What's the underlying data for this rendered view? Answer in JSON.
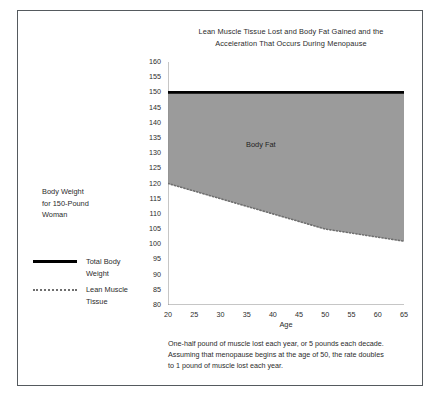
{
  "chart_data": {
    "type": "area",
    "title": "Lean Muscle Tissue Lost and Body Fat Gained and the Acceleration That Occurs During Menopause",
    "title_line1": "Lean Muscle Tissue Lost and Body Fat Gained and the",
    "title_line2": "Acceleration That Occurs During Menopause",
    "xlabel": "Age",
    "ylabel": "",
    "xlim": [
      20,
      65
    ],
    "ylim": [
      80,
      160
    ],
    "xticks": [
      20,
      25,
      30,
      35,
      40,
      45,
      50,
      55,
      60,
      65
    ],
    "yticks": [
      80,
      85,
      90,
      95,
      100,
      105,
      110,
      115,
      120,
      125,
      130,
      135,
      140,
      145,
      150,
      155,
      160
    ],
    "grid": false,
    "legend_position": "left",
    "x": [
      20,
      25,
      30,
      35,
      40,
      45,
      50,
      55,
      60,
      65
    ],
    "series": [
      {
        "name": "Total Body Weight",
        "style": "solid-thick",
        "color": "#000000",
        "values": [
          150,
          150,
          150,
          150,
          150,
          150,
          150,
          150,
          150,
          150
        ]
      },
      {
        "name": "Lean Muscle Tissue",
        "style": "dotted",
        "color": "#6f6f6f",
        "values": [
          120,
          117.5,
          115,
          112.5,
          110,
          107.5,
          105,
          103.7,
          102.4,
          101
        ]
      }
    ],
    "fill": {
      "label": "Body Fat",
      "between": [
        "Total Body Weight",
        "Lean Muscle Tissue"
      ],
      "color": "#9b9b9b"
    },
    "annotations": [
      {
        "name": "body-fat-region-label",
        "text": "Body Fat"
      },
      {
        "name": "body-fat-range-arrow",
        "text": "",
        "from": 150,
        "to": 101,
        "at_x": 65
      }
    ]
  },
  "legend": {
    "note_line1": "Body Weight",
    "note_line2": "for 150-Pound",
    "note_line3": "Woman",
    "items": [
      {
        "label_line1": "Total Body",
        "label_line2": "Weight",
        "style": "solid"
      },
      {
        "label_line1": "Lean Muscle",
        "label_line2": "Tissue",
        "style": "dotted"
      }
    ]
  },
  "caption": {
    "line1": "One-half pound of muscle lost each year, or 5 pounds each decade.",
    "line2": "Assuming that menopause begins at the age of 50, the rate doubles",
    "line3": "to 1 pound of muscle lost each year."
  }
}
